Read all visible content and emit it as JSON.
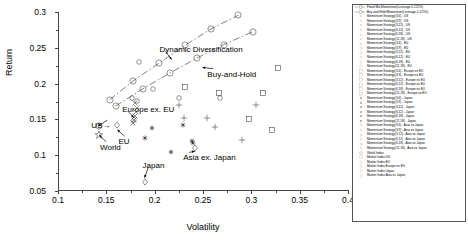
{
  "chart_data": {
    "type": "scatter",
    "title": "",
    "xlabel": "Volatility",
    "ylabel": "Return",
    "xlim": [
      0.1,
      0.4
    ],
    "ylim": [
      0.05,
      0.3
    ],
    "xticks": [
      "0.1",
      "0.15",
      "0.2",
      "0.25",
      "0.3",
      "0.35",
      "0.4"
    ],
    "xtick_values": [
      0.1,
      0.15,
      0.2,
      0.25,
      0.3,
      0.35,
      0.4
    ],
    "yticks": [
      "0.05",
      "0.1",
      "0.15",
      "0.2",
      "0.25",
      "0.3"
    ],
    "ytick_values": [
      0.05,
      0.1,
      0.15,
      0.2,
      0.25,
      0.3
    ],
    "grid": false,
    "legend_position": "right-outside",
    "annotations": [
      {
        "text": "Dynamic Diversification",
        "x": 0.205,
        "y": 0.2465,
        "arrow_to_x": 0.2175,
        "arrow_to_y": 0.2335
      },
      {
        "text": "Buy-and-Hold",
        "x": 0.2545,
        "y": 0.2125,
        "arrow_to_x": 0.2495,
        "arrow_to_y": 0.2225
      },
      {
        "text": "Europe ex. EU",
        "x": 0.1665,
        "y": 0.1625,
        "arrow_to_x": 0.1785,
        "arrow_to_y": 0.1525
      },
      {
        "text": "US→",
        "x": 0.1345,
        "y": 0.1405,
        "arrow_to_x": 0.1415,
        "arrow_to_y": 0.1405
      },
      {
        "text": "World",
        "x": 0.1435,
        "y": 0.1105,
        "arrow_to_x": 0.1425,
        "arrow_to_y": 0.1285
      },
      {
        "text": "EU",
        "x": 0.1625,
        "y": 0.1185,
        "arrow_to_x": 0.1615,
        "arrow_to_y": 0.1355
      },
      {
        "text": "Japan",
        "x": 0.1875,
        "y": 0.0855,
        "arrow_to_x": 0.1895,
        "arrow_to_y": 0.0685
      },
      {
        "text": "Asia ex. Japan",
        "x": 0.2295,
        "y": 0.0955,
        "arrow_to_x": 0.2415,
        "arrow_to_y": 0.1055
      }
    ],
    "series": [
      {
        "name": "Fixed Mix Momentum(Leverage 0-125%)",
        "marker": "circle-line",
        "line": "dashdot",
        "points": [
          {
            "x": 0.1535,
            "y": 0.1775
          },
          {
            "x": 0.1775,
            "y": 0.2035
          },
          {
            "x": 0.2045,
            "y": 0.2285
          },
          {
            "x": 0.2315,
            "y": 0.2535
          },
          {
            "x": 0.2585,
            "y": 0.2765
          },
          {
            "x": 0.2865,
            "y": 0.2955
          }
        ]
      },
      {
        "name": "Buy and Hold:Momentum(Leverage 0-125%)",
        "marker": "circle-line",
        "line": "dashdot",
        "points": [
          {
            "x": 0.1595,
            "y": 0.1685
          },
          {
            "x": 0.1875,
            "y": 0.1925
          },
          {
            "x": 0.2155,
            "y": 0.2145
          },
          {
            "x": 0.2435,
            "y": 0.2355
          },
          {
            "x": 0.2715,
            "y": 0.2545
          },
          {
            "x": 0.3015,
            "y": 0.2725
          }
        ]
      },
      {
        "name": "Momentum Strategy(3,6) - US",
        "marker": "x-thin",
        "points": [
          {
            "x": 0.1795,
            "y": 0.1735
          }
        ]
      },
      {
        "name": "Momentum Strategy(3,9) - US",
        "marker": "x-thin",
        "points": [
          {
            "x": 0.1815,
            "y": 0.1665
          }
        ]
      },
      {
        "name": "Momentum Strategy(3,12) - US",
        "marker": "x-thin",
        "points": [
          {
            "x": 0.1805,
            "y": 0.1605
          }
        ]
      },
      {
        "name": "Momentum Strategy(6,12) - US",
        "marker": "x-thin",
        "points": [
          {
            "x": 0.1795,
            "y": 0.1545
          }
        ]
      },
      {
        "name": "Momentum Strategy(6,18) - US",
        "marker": "x-thin",
        "points": [
          {
            "x": 0.1785,
            "y": 0.1485
          }
        ]
      },
      {
        "name": "Momentum Strategy(12,18) - US",
        "marker": "x-thin",
        "points": [
          {
            "x": 0.1775,
            "y": 0.1445
          }
        ]
      },
      {
        "name": "Momentum Strategy(3,6) - EU",
        "marker": "circle-sm",
        "points": [
          {
            "x": 0.1765,
            "y": 0.1795
          }
        ]
      },
      {
        "name": "Momentum Strategy(3,9) - EU",
        "marker": "circle-sm",
        "points": [
          {
            "x": 0.1815,
            "y": 0.1755
          }
        ]
      },
      {
        "name": "Momentum Strategy(3,12) - EU",
        "marker": "circle-sm",
        "points": [
          {
            "x": 0.1835,
            "y": 0.2305
          }
        ]
      },
      {
        "name": "Momentum Strategy(6,12) - EU",
        "marker": "circle-sm",
        "points": [
          {
            "x": 0.1985,
            "y": 0.1925
          }
        ]
      },
      {
        "name": "Momentum Strategy(6,18) - EU",
        "marker": "circle-sm",
        "points": [
          {
            "x": 0.2255,
            "y": 0.1805
          }
        ]
      },
      {
        "name": "Momentum Strategy(12,18) - EU",
        "marker": "circle-sm",
        "points": [
          {
            "x": 0.2675,
            "y": 0.1795
          }
        ]
      },
      {
        "name": "Momentum Strategy(3,6) - Europe ex EU",
        "marker": "square",
        "points": [
          {
            "x": 0.2315,
            "y": 0.1955
          }
        ]
      },
      {
        "name": "Momentum Strategy(3,9) - Europe ex EU",
        "marker": "square",
        "points": [
          {
            "x": 0.2665,
            "y": 0.1875
          }
        ]
      },
      {
        "name": "Momentum Strategy(3,12) - Europe ex EU",
        "marker": "square",
        "points": [
          {
            "x": 0.2975,
            "y": 0.1505
          }
        ]
      },
      {
        "name": "Momentum Strategy(6,12) - Europe ex EU",
        "marker": "square",
        "points": [
          {
            "x": 0.3125,
            "y": 0.1875
          }
        ]
      },
      {
        "name": "Momentum Strategy(6,18) - Europe ex EU",
        "marker": "square",
        "points": [
          {
            "x": 0.3275,
            "y": 0.2215
          }
        ]
      },
      {
        "name": "Momentum Strategy(12,18) - Europe ex EU",
        "marker": "square",
        "points": [
          {
            "x": 0.3215,
            "y": 0.1345
          }
        ]
      },
      {
        "name": "Momentum Strategy(3,6) - Japan",
        "marker": "star-dot",
        "points": [
          {
            "x": 0.2165,
            "y": 0.1045
          }
        ]
      },
      {
        "name": "Momentum Strategy(3,9) - Japan",
        "marker": "star-dot",
        "points": [
          {
            "x": 0.2295,
            "y": 0.1425
          }
        ]
      },
      {
        "name": "Momentum Strategy(3,12) - Japan",
        "marker": "star-dot",
        "points": [
          {
            "x": 0.2385,
            "y": 0.1195
          }
        ]
      },
      {
        "name": "Momentum Strategy(6,12) - Japan",
        "marker": "star-dot",
        "points": [
          {
            "x": 0.2395,
            "y": 0.1165
          }
        ]
      },
      {
        "name": "Momentum Strategy(6,18) - Japan",
        "marker": "star-dot",
        "points": [
          {
            "x": 0.1905,
            "y": 0.1245
          }
        ]
      },
      {
        "name": "Momentum Strategy(12,18) - Japan",
        "marker": "star-dot",
        "points": [
          {
            "x": 0.1975,
            "y": 0.1375
          }
        ]
      },
      {
        "name": "Momentum Strategy(3,6) - Asia ex Japan",
        "marker": "plus",
        "points": [
          {
            "x": 0.2305,
            "y": 0.1515
          }
        ]
      },
      {
        "name": "Momentum Strategy(3,9) - Asia ex Japan",
        "marker": "plus",
        "points": [
          {
            "x": 0.2545,
            "y": 0.1525
          }
        ]
      },
      {
        "name": "Momentum Strategy(3,12) - Asia ex Japan",
        "marker": "plus",
        "points": [
          {
            "x": 0.2255,
            "y": 0.1705
          }
        ]
      },
      {
        "name": "Momentum Strategy(6,12) - Asia ex Japan",
        "marker": "plus",
        "points": [
          {
            "x": 0.2625,
            "y": 0.1395
          }
        ]
      },
      {
        "name": "Momentum Strategy(6,18) - Asia ex Japan",
        "marker": "plus",
        "points": [
          {
            "x": 0.2905,
            "y": 0.1215
          }
        ]
      },
      {
        "name": "Momentum Strategy(12,18) - Asia ex Japan",
        "marker": "plus",
        "points": [
          {
            "x": 0.3045,
            "y": 0.1705
          }
        ]
      },
      {
        "name": "World Index",
        "marker": "star-open",
        "points": [
          {
            "x": 0.1425,
            "y": 0.1285
          }
        ]
      },
      {
        "name": "Market Index:US",
        "marker": "circle-md",
        "points": [
          {
            "x": 0.1425,
            "y": 0.1405
          }
        ]
      },
      {
        "name": "Market Index:EU",
        "marker": "diamond",
        "points": [
          {
            "x": 0.1615,
            "y": 0.1425
          }
        ]
      },
      {
        "name": "Market Index:Europe ex EU",
        "marker": "diamond",
        "points": [
          {
            "x": 0.1785,
            "y": 0.1495
          }
        ]
      },
      {
        "name": "Market Index:Japan",
        "marker": "diamond",
        "points": [
          {
            "x": 0.1895,
            "y": 0.0625
          }
        ]
      },
      {
        "name": "Market Index:Asia ex Japan",
        "marker": "diamond",
        "points": [
          {
            "x": 0.2415,
            "y": 0.1095
          }
        ]
      }
    ]
  }
}
